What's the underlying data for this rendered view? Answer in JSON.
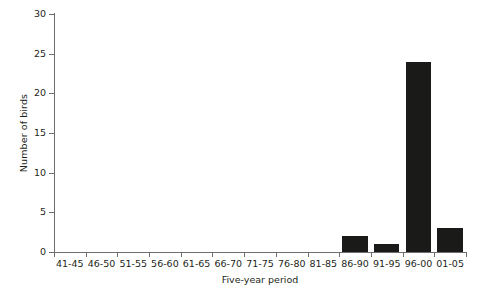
{
  "chart_data": {
    "type": "bar",
    "title": "",
    "xlabel": "Five-year period",
    "ylabel": "Number of birds",
    "categories": [
      "41-45",
      "46-50",
      "51-55",
      "56-60",
      "61-65",
      "66-70",
      "71-75",
      "76-80",
      "81-85",
      "86-90",
      "91-95",
      "96-00",
      "01-05"
    ],
    "values": [
      0,
      0,
      0,
      0,
      0,
      0,
      0,
      0,
      0,
      2,
      1,
      24,
      3
    ],
    "ylim": [
      0,
      30
    ],
    "yticks": [
      0,
      5,
      10,
      15,
      20,
      25,
      30
    ],
    "ytick_labels": [
      "0",
      "5",
      "10",
      "15",
      "20",
      "25",
      "30"
    ],
    "grid": false,
    "legend": null,
    "bar_color": "#1a1a18",
    "axis_color": "#6d6e71",
    "text_color": "#231f20"
  }
}
